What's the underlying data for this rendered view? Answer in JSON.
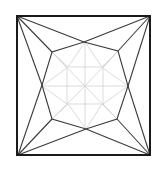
{
  "diagram": {
    "title": "",
    "colors": {
      "background": "#ffffff",
      "outer_square": "#1a1a1a",
      "dark_lines": "#3a3a3a",
      "light_lines": "#cfcfcf"
    },
    "outer_square": {
      "x": 17,
      "y": 16,
      "width": 133,
      "height": 139
    },
    "octagon_points": [
      [
        84,
        42
      ],
      [
        118,
        51
      ],
      [
        128,
        86
      ],
      [
        117,
        119
      ],
      [
        86,
        129
      ],
      [
        52,
        119
      ],
      [
        42,
        85
      ],
      [
        52,
        52
      ]
    ],
    "center": [
      85,
      86
    ]
  }
}
